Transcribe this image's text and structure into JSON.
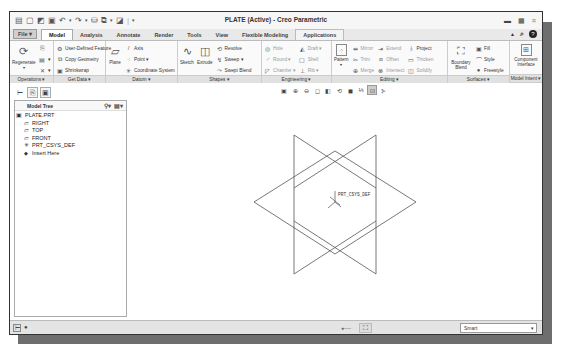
{
  "window": {
    "title": "PLATE (Active) - Creo Parametric",
    "controls": [
      "minimize",
      "maximize",
      "close"
    ]
  },
  "quick_access": [
    "new-icon",
    "open-icon",
    "save-icon",
    "undo-icon",
    "redo-icon",
    "regenerate-icon",
    "windows-icon",
    "close-window-icon"
  ],
  "tabs": [
    {
      "label": "File ▾",
      "id": "file"
    },
    {
      "label": "Model",
      "id": "model",
      "active": true
    },
    {
      "label": "Analysis",
      "id": "analysis"
    },
    {
      "label": "Annotate",
      "id": "annotate"
    },
    {
      "label": "Render",
      "id": "render"
    },
    {
      "label": "Tools",
      "id": "tools"
    },
    {
      "label": "View",
      "id": "view"
    },
    {
      "label": "Flexible Modeling",
      "id": "flexible-modeling"
    },
    {
      "label": "Applications",
      "id": "applications"
    }
  ],
  "ribbon": {
    "operations": {
      "label": "Operations ▾",
      "regenerate": "Regenerate"
    },
    "get_data": {
      "label": "Get Data ▾",
      "items": [
        "User-Defined Feature",
        "Copy Geometry",
        "Shrinkwrap"
      ]
    },
    "datum": {
      "label": "Datum ▾",
      "plane": "Plane",
      "items": [
        "Axis",
        "Point ▾",
        "Coordinate System"
      ]
    },
    "shapes": {
      "label": "Shapes ▾",
      "sketch": "Sketch",
      "extrude": "Extrude",
      "items": [
        "Revolve",
        "Sweep ▾",
        "Swept Blend"
      ]
    },
    "engineering": {
      "label": "Engineering ▾",
      "col1": [
        "Hole",
        "Round ▾",
        "Chamfer ▾"
      ],
      "col2": [
        "Draft ▾",
        "Shell",
        "Rib ▾"
      ]
    },
    "editing": {
      "label": "Editing ▾",
      "pattern": "Pattern",
      "col1": [
        "Mirror",
        "Trim",
        "Merge"
      ],
      "col2": [
        "Extend",
        "Offset",
        "Intersect"
      ],
      "col3": [
        "Project",
        "Thicken",
        "Solidify"
      ]
    },
    "surfaces": {
      "label": "Surfaces ▾",
      "boundary_blend": "Boundary Blend",
      "items": [
        "Fill",
        "Style",
        "Freestyle"
      ]
    },
    "model_intent": {
      "label": "Model Intent ▾",
      "component_interface": "Component Interface"
    }
  },
  "model_tree": {
    "header": "Model Tree",
    "items": [
      {
        "label": "PLATE.PRT",
        "icon": "part-icon",
        "indent": 0
      },
      {
        "label": "RIGHT",
        "icon": "datum-plane-icon",
        "indent": 1
      },
      {
        "label": "TOP",
        "icon": "datum-plane-icon",
        "indent": 1
      },
      {
        "label": "FRONT",
        "icon": "datum-plane-icon",
        "indent": 1
      },
      {
        "label": "PRT_CSYS_DEF",
        "icon": "csys-icon",
        "indent": 1
      },
      {
        "label": "Insert Here",
        "icon": "insert-icon",
        "indent": 1
      }
    ]
  },
  "viewport": {
    "csys_label": "PRT_CSYS_DEF",
    "toolbar": [
      "refit-icon",
      "zoom-in-icon",
      "zoom-out-icon",
      "repaint-icon",
      "saved-orientations-icon",
      "view-manager-icon",
      "display-style-icon",
      "datum-display-icon",
      "spin-center-icon",
      "annotation-display-icon"
    ]
  },
  "status_bar": {
    "filter_value": "Smart"
  }
}
